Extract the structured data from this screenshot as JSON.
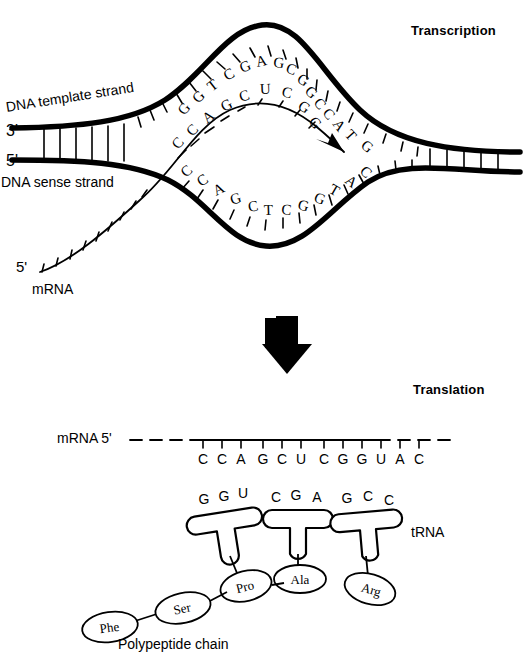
{
  "figure": {
    "title_transcription": "Transcription",
    "title_translation": "Translation",
    "polypeptide_caption": "Polypeptide chain",
    "trna_caption": "tRNA"
  },
  "transcription": {
    "template_strand_label": "DNA template strand",
    "sense_strand_label": "DNA sense strand",
    "template_end_label": "3'",
    "sense_end_label": "5'",
    "mrna_label": "mRNA",
    "mrna_end_label": "5'",
    "template_bases": [
      "G",
      "G",
      "T",
      "C",
      "G",
      "A",
      "G",
      "C",
      "G",
      "G",
      "C",
      "C",
      "A",
      "T",
      "G"
    ],
    "sense_bases": [
      "C",
      "C",
      "A",
      "G",
      "C",
      "T",
      "C",
      "G",
      "G",
      "T",
      "A",
      "C"
    ],
    "nascent_mrna_bases": [
      "C",
      "C",
      "A",
      "G",
      "C",
      "U",
      "C",
      "G",
      "G"
    ]
  },
  "translation": {
    "mrna_label": "mRNA 5'",
    "mrna_bases": [
      "C",
      "C",
      "A",
      "G",
      "C",
      "U",
      "C",
      "G",
      "G",
      "U",
      "A",
      "C"
    ],
    "trnas": [
      {
        "anticodon": [
          "G",
          "G",
          "U"
        ],
        "amino_acid": "Pro"
      },
      {
        "anticodon": [
          "C",
          "G",
          "A"
        ],
        "amino_acid": "Ala"
      },
      {
        "anticodon": [
          "G",
          "C",
          "C"
        ],
        "amino_acid": "Arg"
      }
    ],
    "polypeptide": [
      "Phe",
      "Ser",
      "Pro",
      "Ala",
      "Arg"
    ]
  },
  "colors": {
    "ink": "#000000",
    "background": "#ffffff"
  }
}
